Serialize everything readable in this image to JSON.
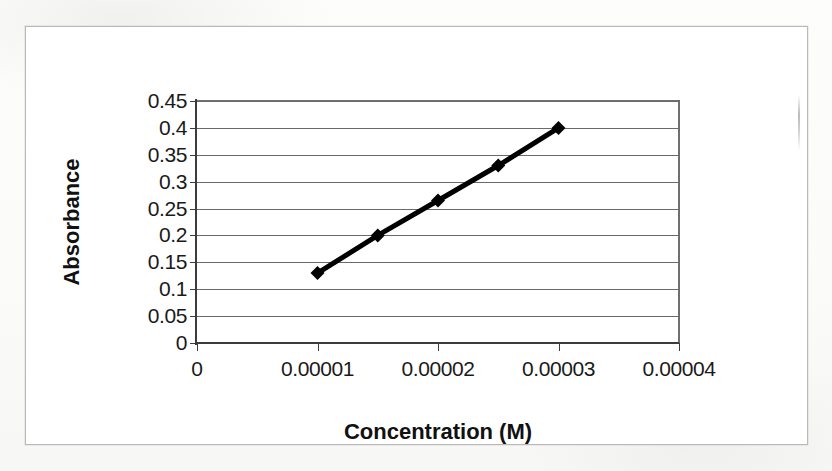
{
  "chart_data": {
    "type": "line",
    "title": "",
    "xlabel": "Concentration (M)",
    "ylabel": "Absorbance",
    "x": [
      1e-05,
      1.5e-05,
      2e-05,
      2.5e-05,
      3e-05
    ],
    "values": [
      0.13,
      0.2,
      0.265,
      0.33,
      0.4
    ],
    "series": [
      {
        "name": "Absorbance",
        "x": [
          1e-05,
          1.5e-05,
          2e-05,
          2.5e-05,
          3e-05
        ],
        "values": [
          0.13,
          0.2,
          0.265,
          0.33,
          0.4
        ]
      }
    ],
    "xlim": [
      0,
      4e-05
    ],
    "ylim": [
      0,
      0.45
    ],
    "xticks": [
      "0",
      "0.00001",
      "0.00002",
      "0.00003",
      "0.00004"
    ],
    "xtick_values": [
      0,
      1e-05,
      2e-05,
      3e-05,
      4e-05
    ],
    "yticks": [
      "0",
      "0.05",
      "0.1",
      "0.15",
      "0.2",
      "0.25",
      "0.3",
      "0.35",
      "0.4",
      "0.45"
    ],
    "ytick_values": [
      0,
      0.05,
      0.1,
      0.15,
      0.2,
      0.25,
      0.3,
      0.35,
      0.4,
      0.45
    ],
    "grid": "horizontal",
    "legend": "none",
    "marker": "diamond",
    "line_color": "#000000",
    "marker_color": "#000000",
    "gridline_color": "#6a6a6a",
    "axis_color": "#3c3c3c",
    "plot_background": "#ffffff",
    "page_background": "#fbfbfa"
  }
}
